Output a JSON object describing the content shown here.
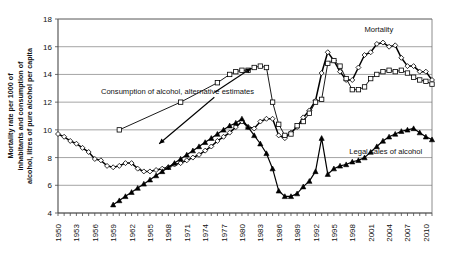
{
  "chart_data": {
    "type": "line",
    "title": "",
    "xlabel": "",
    "ylabel": "Mortality rate per 1000 of inhabitants and consumption of alcohol, litres of pure alcohol per capita",
    "ylim": [
      4,
      18
    ],
    "yticks": [
      4,
      6,
      8,
      10,
      12,
      14,
      16,
      18
    ],
    "ytick_labels": [
      "4",
      "6",
      "8",
      "10",
      "12",
      "14",
      "16",
      "18"
    ],
    "xlim": [
      1950,
      2011
    ],
    "xticks": [
      1950,
      1953,
      1956,
      1959,
      1962,
      1965,
      1968,
      1971,
      1974,
      1977,
      1980,
      1983,
      1986,
      1989,
      1992,
      1995,
      1998,
      2001,
      2004,
      2007,
      2010
    ],
    "xtick_labels": [
      "1950",
      "1953",
      "1956",
      "1959",
      "1962",
      "1965",
      "1968",
      "1971",
      "1974",
      "1977",
      "1980",
      "1983",
      "1986",
      "1989",
      "1992",
      "1995",
      "1998",
      "2001",
      "2004",
      "2007",
      "2010"
    ],
    "grid": true,
    "legend_position": "inline-annotations",
    "annotations": [
      {
        "name": "mortality",
        "text": "Mortality",
        "x": 2000.0,
        "y": 17.05
      },
      {
        "name": "alternative-estimates",
        "text": "Consumption of alcohol, alternative estimates",
        "x": 1957.0,
        "y": 12.6
      },
      {
        "name": "legal-sales",
        "text": "Legal sales of alcohol",
        "x": 1997.5,
        "y": 8.25
      }
    ],
    "series": [
      {
        "name": "Mortality",
        "marker": "diamond",
        "x": [
          1950,
          1951,
          1952,
          1953,
          1954,
          1955,
          1956,
          1957,
          1958,
          1959,
          1960,
          1961,
          1962,
          1963,
          1964,
          1965,
          1966,
          1967,
          1968,
          1969,
          1970,
          1971,
          1972,
          1973,
          1974,
          1975,
          1976,
          1977,
          1978,
          1979,
          1980,
          1981,
          1982,
          1983,
          1984,
          1985,
          1986,
          1987,
          1988,
          1989,
          1990,
          1991,
          1992,
          1993,
          1994,
          1995,
          1996,
          1997,
          1998,
          1999,
          2000,
          2001,
          2002,
          2003,
          2004,
          2005,
          2006,
          2007,
          2008,
          2009,
          2010,
          2011
        ],
        "values": [
          9.7,
          9.5,
          9.2,
          9.0,
          8.7,
          8.4,
          7.9,
          7.8,
          7.4,
          7.3,
          7.4,
          7.6,
          7.6,
          7.2,
          7.0,
          7.0,
          7.1,
          7.2,
          7.3,
          7.5,
          7.6,
          7.8,
          8.0,
          8.2,
          8.5,
          8.8,
          9.2,
          9.5,
          9.8,
          10.2,
          10.6,
          10.2,
          10.1,
          10.6,
          10.8,
          10.8,
          9.6,
          9.4,
          9.8,
          10.2,
          10.9,
          11.4,
          12.1,
          14.1,
          15.6,
          15.0,
          14.2,
          13.6,
          13.6,
          14.5,
          15.4,
          15.6,
          16.2,
          16.3,
          16.0,
          16.1,
          15.2,
          14.6,
          14.6,
          14.2,
          14.2,
          13.6
        ]
      },
      {
        "name": "Consumption of alcohol, alternative estimates",
        "marker": "square",
        "x": [
          1960,
          1970,
          1976,
          1978,
          1979,
          1980,
          1981,
          1982,
          1983,
          1984,
          1985,
          1986,
          1987,
          1988,
          1989,
          1990,
          1991,
          1992,
          1993,
          1994,
          1995,
          1996,
          1997,
          1998,
          1999,
          2000,
          2001,
          2002,
          2003,
          2004,
          2005,
          2006,
          2007,
          2008,
          2009,
          2010,
          2011
        ],
        "values": [
          10.0,
          12.0,
          13.4,
          14.0,
          14.2,
          14.3,
          14.3,
          14.5,
          14.6,
          14.5,
          12.0,
          10.4,
          9.6,
          9.7,
          10.3,
          10.6,
          11.2,
          12.0,
          12.2,
          14.8,
          15.0,
          14.6,
          13.7,
          12.9,
          12.9,
          13.1,
          13.7,
          14.0,
          14.2,
          14.3,
          14.2,
          14.3,
          14.1,
          13.8,
          13.6,
          13.5,
          13.3
        ]
      },
      {
        "name": "Legal sales of alcohol",
        "marker": "triangle",
        "x": [
          1959,
          1960,
          1961,
          1962,
          1963,
          1964,
          1965,
          1966,
          1967,
          1968,
          1969,
          1970,
          1971,
          1972,
          1973,
          1974,
          1975,
          1976,
          1977,
          1978,
          1979,
          1980,
          1981,
          1982,
          1983,
          1984,
          1985,
          1986,
          1987,
          1988,
          1989,
          1990,
          1991,
          1992,
          1993,
          1994,
          1995,
          1996,
          1997,
          1998,
          1999,
          2000,
          2001,
          2002,
          2003,
          2004,
          2005,
          2006,
          2007,
          2008,
          2009,
          2010,
          2011
        ],
        "values": [
          4.6,
          4.9,
          5.2,
          5.5,
          5.8,
          6.1,
          6.4,
          6.7,
          7.0,
          7.3,
          7.6,
          7.9,
          8.2,
          8.5,
          8.8,
          9.1,
          9.4,
          9.7,
          10.0,
          10.3,
          10.5,
          10.8,
          10.2,
          9.6,
          9.0,
          8.3,
          7.2,
          5.6,
          5.2,
          5.2,
          5.4,
          5.9,
          6.3,
          7.0,
          9.4,
          6.8,
          7.2,
          7.4,
          7.5,
          7.7,
          7.8,
          8.0,
          8.4,
          8.8,
          9.2,
          9.5,
          9.7,
          9.9,
          10.0,
          10.1,
          9.8,
          9.5,
          9.3
        ]
      }
    ]
  }
}
